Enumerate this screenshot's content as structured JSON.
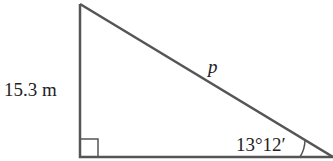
{
  "diagram": {
    "type": "right-triangle",
    "side_label": "15.3 m",
    "hypotenuse_label": "p",
    "angle_label": "13°12′",
    "right_angle_marker": true,
    "stroke_color": "#555555"
  }
}
